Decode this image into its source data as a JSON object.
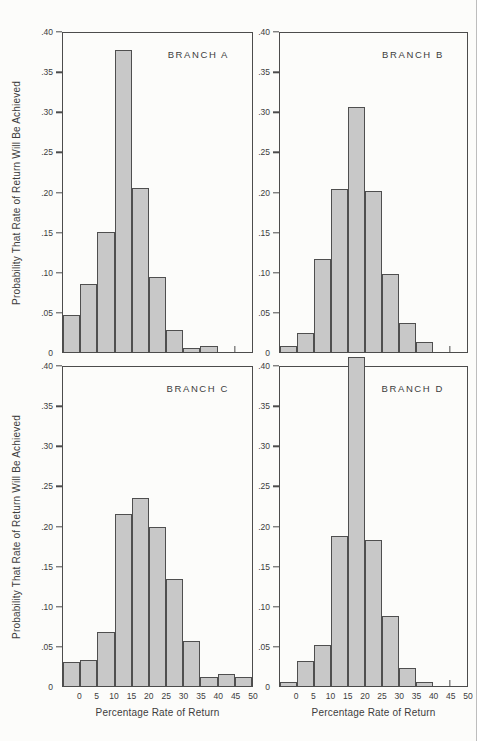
{
  "figure": {
    "y_axis_title": "Probability That Rate of Return Will Be Achieved",
    "x_axis_title": "Percentage Rate of Return",
    "y_tick_labels": [
      ".40",
      ".35",
      ".30",
      ".25",
      ".20",
      ".15",
      ".10",
      ".05",
      "0"
    ],
    "x_tick_labels": [
      "0",
      "5",
      "10",
      "15",
      "20",
      "25",
      "30",
      "35",
      "40",
      "45",
      "50"
    ],
    "colors": {
      "bar_fill": "#c8c8c8",
      "bar_border": "#4f4f4f",
      "frame": "#4c4c4c",
      "text": "#3d3d3d",
      "background": "#fcfcfa"
    }
  },
  "chart_data": [
    {
      "type": "bar",
      "title": "BRANCH A",
      "position": "top-left",
      "xlabel": "Percentage Rate of Return",
      "ylabel": "Probability That Rate of Return Will Be Achieved",
      "xlim": [
        -5,
        50
      ],
      "ylim": [
        0,
        0.4
      ],
      "bin_edges": [
        -5,
        0,
        5,
        10,
        15,
        20,
        25,
        30,
        35,
        40
      ],
      "values": [
        0.046,
        0.085,
        0.151,
        0.379,
        0.206,
        0.094,
        0.028,
        0.005,
        0.008
      ],
      "axis_tick_at_x": 45,
      "show_x_tick_labels": false,
      "show_y_axis_title": true,
      "grid": false
    },
    {
      "type": "bar",
      "title": "BRANCH B",
      "position": "top-right",
      "xlabel": "Percentage Rate of Return",
      "ylabel": "Probability That Rate of Return Will Be Achieved",
      "xlim": [
        -5,
        50
      ],
      "ylim": [
        0,
        0.4
      ],
      "bin_edges": [
        -5,
        0,
        5,
        10,
        15,
        20,
        25,
        30,
        35,
        40
      ],
      "values": [
        0.007,
        0.024,
        0.117,
        0.205,
        0.307,
        0.202,
        0.098,
        0.037,
        0.012
      ],
      "axis_tick_at_x": 45,
      "show_x_tick_labels": false,
      "show_y_axis_title": false,
      "grid": false
    },
    {
      "type": "bar",
      "title": "BRANCH C",
      "position": "bottom-left",
      "xlabel": "Percentage Rate of Return",
      "ylabel": "Probability That Rate of Return Will Be Achieved",
      "xlim": [
        -5,
        50
      ],
      "ylim": [
        0,
        0.4
      ],
      "bin_edges": [
        -5,
        0,
        5,
        10,
        15,
        20,
        25,
        30,
        35,
        40,
        45,
        50
      ],
      "values": [
        0.03,
        0.033,
        0.068,
        0.216,
        0.236,
        0.2,
        0.134,
        0.056,
        0.011,
        0.015,
        0.011
      ],
      "axis_tick_at_x": null,
      "show_x_tick_labels": true,
      "show_y_axis_title": true,
      "grid": false
    },
    {
      "type": "bar",
      "title": "BRANCH D",
      "position": "bottom-right",
      "xlabel": "Percentage Rate of Return",
      "ylabel": "Probability That Rate of Return Will Be Achieved",
      "xlim": [
        -5,
        50
      ],
      "ylim": [
        0,
        0.4
      ],
      "bin_edges": [
        -5,
        0,
        5,
        10,
        15,
        20,
        25,
        30,
        35,
        40
      ],
      "values": [
        0.005,
        0.031,
        0.052,
        0.188,
        0.412,
        0.183,
        0.088,
        0.022,
        0.005
      ],
      "axis_tick_at_x": 45,
      "show_x_tick_labels": true,
      "show_y_axis_title": false,
      "grid": false
    }
  ]
}
